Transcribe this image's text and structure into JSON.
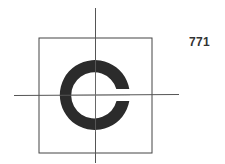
{
  "figure": {
    "label": "771",
    "symbol": "landolt-c-ring",
    "gap_direction": "right",
    "colors": {
      "ring": "#2b2b2b",
      "lines": "#444444",
      "label": "#333333",
      "background": "#ffffff"
    }
  }
}
